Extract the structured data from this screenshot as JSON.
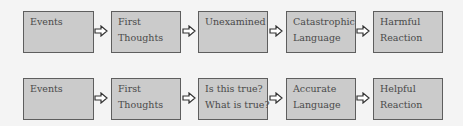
{
  "diagram": {
    "type": "flowchart",
    "colors": {
      "box_fill": "#cbcbcb",
      "box_border": "#5e5e5e",
      "text": "#4a4a4a",
      "background": "#f4f4f4",
      "arrow_fill": "#ffffff",
      "arrow_stroke": "#333333"
    },
    "rows": [
      {
        "name": "unhelpful-chain",
        "steps": [
          {
            "line1": "Events",
            "line2": ""
          },
          {
            "line1": "First",
            "line2": "Thoughts"
          },
          {
            "line1": "Unexamined",
            "line2": ""
          },
          {
            "line1": "Catastrophic",
            "line2": "Language"
          },
          {
            "line1": "Harmful",
            "line2": "Reaction"
          }
        ]
      },
      {
        "name": "helpful-chain",
        "steps": [
          {
            "line1": "Events",
            "line2": ""
          },
          {
            "line1": "First",
            "line2": "Thoughts"
          },
          {
            "line1": "Is this true?",
            "line2": "What is true?"
          },
          {
            "line1": "Accurate",
            "line2": "Language"
          },
          {
            "line1": "Helpful",
            "line2": "Reaction"
          }
        ]
      }
    ],
    "arrow_icon": "hollow-right-arrow-icon"
  }
}
